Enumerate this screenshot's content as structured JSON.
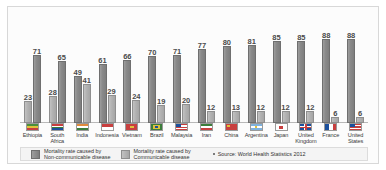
{
  "chart_data": {
    "type": "bar",
    "title": "",
    "xlabel": "",
    "ylabel": "",
    "ylim": [
      0,
      100
    ],
    "grid": false,
    "legend_position": "bottom",
    "categories": [
      "Ethiopia",
      "South Africa",
      "India",
      "Indonesia",
      "Vietnam",
      "Brazil",
      "Malaysia",
      "Iran",
      "China",
      "Argentina",
      "Japan",
      "United Kingdom",
      "France",
      "United States"
    ],
    "series": [
      {
        "name": "Mortality rate caused by Non-communicable disease",
        "values": [
          71,
          65,
          49,
          61,
          66,
          70,
          71,
          77,
          80,
          81,
          85,
          85,
          88,
          88
        ]
      },
      {
        "name": "Mortality rate caused by Communicable disease",
        "values": [
          23,
          28,
          41,
          29,
          24,
          19,
          20,
          12,
          13,
          12,
          12,
          12,
          6,
          6
        ]
      }
    ],
    "bars": [
      {
        "country": "Ethiopia",
        "non_communicable": 71,
        "communicable": 23,
        "order": "communicable-first"
      },
      {
        "country": "South Africa",
        "non_communicable": 65,
        "communicable": 28,
        "order": "communicable-first"
      },
      {
        "country": "India",
        "non_communicable": 49,
        "communicable": 41,
        "order": "noncommunicable-first"
      },
      {
        "country": "Indonesia",
        "non_communicable": 61,
        "communicable": 29,
        "order": "noncommunicable-first"
      },
      {
        "country": "Vietnam",
        "non_communicable": 66,
        "communicable": 24,
        "order": "noncommunicable-first"
      },
      {
        "country": "Brazil",
        "non_communicable": 70,
        "communicable": 19,
        "order": "noncommunicable-first"
      },
      {
        "country": "Malaysia",
        "non_communicable": 71,
        "communicable": 20,
        "order": "noncommunicable-first"
      },
      {
        "country": "Iran",
        "non_communicable": 77,
        "communicable": 12,
        "order": "noncommunicable-first"
      },
      {
        "country": "China",
        "non_communicable": 80,
        "communicable": 13,
        "order": "noncommunicable-first"
      },
      {
        "country": "Argentina",
        "non_communicable": 81,
        "communicable": 12,
        "order": "noncommunicable-first"
      },
      {
        "country": "Japan",
        "non_communicable": 85,
        "communicable": 12,
        "order": "noncommunicable-first"
      },
      {
        "country": "United Kingdom",
        "non_communicable": 85,
        "communicable": 12,
        "order": "noncommunicable-first"
      },
      {
        "country": "France",
        "non_communicable": 88,
        "communicable": 6,
        "order": "noncommunicable-first"
      },
      {
        "country": "United States",
        "non_communicable": 88,
        "communicable": 6,
        "order": "noncommunicable-first"
      }
    ],
    "legend": [
      "Mortality rate caused by\nNon-communicable disease",
      "Mortality rate caused by\nCommunicable disease"
    ],
    "annotations": [
      "Source: World Health Statistics 2012"
    ]
  },
  "axis": {
    "labels": [
      "Ethiopia",
      "South\nAfrica",
      "India",
      "Indonesia",
      "Vietnam",
      "Brazil",
      "Malaysia",
      "Iran",
      "China",
      "Argentina",
      "Japan",
      "United\nKingdom",
      "France",
      "United\nStates"
    ]
  },
  "legend": {
    "item1": "Mortality rate caused by\nNon-communicable disease",
    "item2": "Mortality rate caused by\nCommunicable disease",
    "source": "Source: World Health Statistics 2012"
  },
  "colors": {
    "bar_dark": "#8a8a8a",
    "bar_light": "#b2b2b2",
    "value_label": "#4a4a4a",
    "card_bg": "#fcfcfc",
    "card_border": "#d8d8d8",
    "legend_bg": "#f4f4f4"
  }
}
